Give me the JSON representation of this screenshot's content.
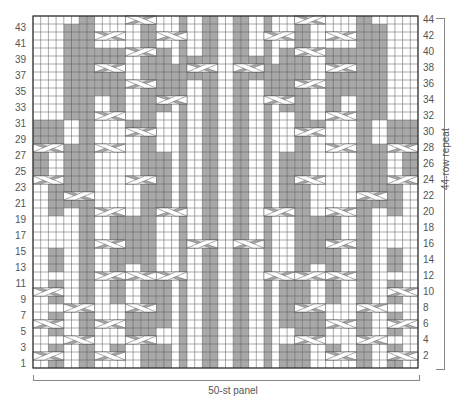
{
  "chart": {
    "stitches": 50,
    "rows": 44,
    "left_row_labels": [
      "1",
      "3",
      "5",
      "7",
      "9",
      "11",
      "13",
      "15",
      "17",
      "19",
      "21",
      "23",
      "25",
      "27",
      "29",
      "31",
      "33",
      "35",
      "37",
      "39",
      "41",
      "43"
    ],
    "right_row_labels": [
      "2",
      "4",
      "6",
      "8",
      "10",
      "12",
      "14",
      "16",
      "18",
      "20",
      "22",
      "24",
      "26",
      "28",
      "30",
      "32",
      "34",
      "36",
      "38",
      "40",
      "42",
      "44"
    ],
    "repeat_label": "44-row repeat",
    "panel_label": "50-st panel",
    "colors": {
      "purl": "#a8a8a8",
      "knit": "#ffffff",
      "grid": "#555555",
      "cable": "#ffffff"
    },
    "constant_gray_cols": [
      6,
      7,
      14,
      15,
      19,
      22,
      23,
      26,
      27,
      30,
      34,
      35,
      42,
      43
    ],
    "gray_segments": [
      [
        2,
        1,
        3
      ],
      [
        2,
        5,
        7
      ],
      [
        2,
        9,
        11
      ],
      [
        2,
        13,
        15
      ],
      [
        0,
        24,
        27
      ],
      [
        2,
        20,
        23
      ],
      [
        2,
        29,
        31
      ],
      [
        10,
        2,
        3
      ],
      [
        12,
        5,
        7
      ],
      [
        10,
        9,
        11
      ],
      [
        16,
        1,
        3
      ],
      [
        16,
        6,
        11
      ],
      [
        10,
        13,
        20
      ],
      [
        12,
        14,
        19
      ],
      [
        4,
        21,
        28
      ],
      [
        16,
        20,
        27
      ],
      [
        12,
        30,
        31
      ],
      [
        10,
        33,
        40
      ],
      [
        8,
        35,
        40
      ],
      [
        4,
        32,
        43
      ],
      [
        16,
        33,
        40
      ],
      [
        18,
        35,
        38
      ],
      [
        20,
        37,
        39
      ],
      [
        0,
        29,
        31
      ],
      [
        46,
        1,
        3
      ],
      [
        46,
        5,
        7
      ],
      [
        46,
        9,
        11
      ],
      [
        46,
        13,
        15
      ],
      [
        48,
        24,
        27
      ],
      [
        46,
        20,
        23
      ],
      [
        46,
        29,
        31
      ],
      [
        38,
        2,
        3
      ],
      [
        36,
        5,
        7
      ],
      [
        38,
        9,
        11
      ],
      [
        32,
        1,
        3
      ],
      [
        32,
        6,
        11
      ],
      [
        38,
        13,
        20
      ],
      [
        36,
        14,
        19
      ],
      [
        44,
        21,
        28
      ],
      [
        32,
        20,
        27
      ],
      [
        36,
        30,
        31
      ],
      [
        38,
        33,
        40
      ],
      [
        40,
        35,
        40
      ],
      [
        44,
        32,
        43
      ],
      [
        32,
        33,
        40
      ],
      [
        30,
        35,
        38
      ],
      [
        28,
        37,
        39
      ],
      [
        48,
        29,
        31
      ]
    ],
    "cables": [
      [
        0,
        2,
        4,
        "r"
      ],
      [
        8,
        2,
        4,
        "l"
      ],
      [
        0,
        6,
        4,
        "l"
      ],
      [
        8,
        6,
        4,
        "r"
      ],
      [
        0,
        10,
        4,
        "r"
      ],
      [
        4,
        4,
        4,
        "l"
      ],
      [
        4,
        8,
        4,
        "r"
      ],
      [
        12,
        4,
        4,
        "r"
      ],
      [
        12,
        8,
        4,
        "l"
      ],
      [
        8,
        12,
        4,
        "r"
      ],
      [
        12,
        12,
        4,
        "l"
      ],
      [
        16,
        12,
        4,
        "r"
      ],
      [
        8,
        16,
        4,
        "l"
      ],
      [
        20,
        16,
        4,
        "r"
      ],
      [
        8,
        20,
        4,
        "r"
      ],
      [
        16,
        20,
        4,
        "l"
      ],
      [
        0,
        24,
        4,
        "l"
      ],
      [
        4,
        22,
        4,
        "r"
      ],
      [
        12,
        24,
        4,
        "r"
      ],
      [
        0,
        28,
        4,
        "r"
      ],
      [
        8,
        28,
        4,
        "l"
      ],
      [
        12,
        30,
        4,
        "l"
      ],
      [
        8,
        32,
        4,
        "r"
      ],
      [
        16,
        34,
        4,
        "r"
      ],
      [
        12,
        36,
        4,
        "l"
      ],
      [
        20,
        38,
        4,
        "r"
      ],
      [
        8,
        38,
        4,
        "l"
      ],
      [
        12,
        40,
        4,
        "r"
      ],
      [
        16,
        42,
        4,
        "l"
      ],
      [
        8,
        42,
        4,
        "r"
      ],
      [
        12,
        44,
        4,
        "l"
      ],
      [
        46,
        2,
        4,
        "l"
      ],
      [
        38,
        2,
        4,
        "r"
      ],
      [
        46,
        6,
        4,
        "r"
      ],
      [
        38,
        6,
        4,
        "l"
      ],
      [
        46,
        10,
        4,
        "l"
      ],
      [
        42,
        4,
        4,
        "r"
      ],
      [
        42,
        8,
        4,
        "l"
      ],
      [
        34,
        4,
        4,
        "l"
      ],
      [
        34,
        8,
        4,
        "r"
      ],
      [
        38,
        12,
        4,
        "l"
      ],
      [
        34,
        12,
        4,
        "r"
      ],
      [
        30,
        12,
        4,
        "l"
      ],
      [
        38,
        16,
        4,
        "r"
      ],
      [
        26,
        16,
        4,
        "l"
      ],
      [
        38,
        20,
        4,
        "l"
      ],
      [
        30,
        20,
        4,
        "r"
      ],
      [
        46,
        24,
        4,
        "r"
      ],
      [
        42,
        22,
        4,
        "l"
      ],
      [
        34,
        24,
        4,
        "l"
      ],
      [
        46,
        28,
        4,
        "l"
      ],
      [
        38,
        28,
        4,
        "r"
      ],
      [
        34,
        30,
        4,
        "r"
      ],
      [
        38,
        32,
        4,
        "l"
      ],
      [
        30,
        34,
        4,
        "l"
      ],
      [
        34,
        36,
        4,
        "r"
      ],
      [
        26,
        38,
        4,
        "l"
      ],
      [
        38,
        38,
        4,
        "r"
      ],
      [
        34,
        40,
        4,
        "l"
      ],
      [
        30,
        42,
        4,
        "r"
      ],
      [
        38,
        42,
        4,
        "l"
      ],
      [
        34,
        44,
        4,
        "r"
      ]
    ]
  }
}
